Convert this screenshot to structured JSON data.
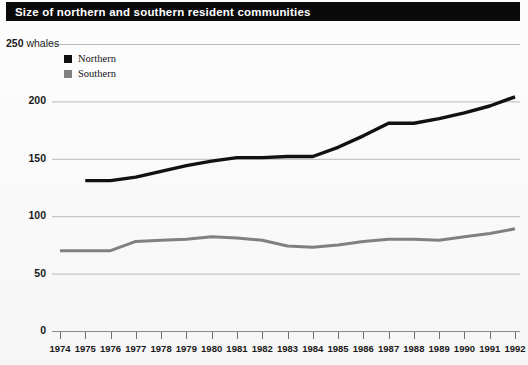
{
  "title": "Size of northern and southern resident communities",
  "legend": {
    "items": [
      {
        "label": "Northern",
        "color": "#111111"
      },
      {
        "label": "Southern",
        "color": "#808080"
      }
    ]
  },
  "axis": {
    "y_unit_label": "whales",
    "y_top_label": "250",
    "y_ticks": [
      "250",
      "200",
      "150",
      "100",
      "50",
      "0"
    ],
    "x_ticks": [
      "1974",
      "1975",
      "1976",
      "1977",
      "1978",
      "1979",
      "1980",
      "1981",
      "1982",
      "1983",
      "1984",
      "1985",
      "1986",
      "1987",
      "1988",
      "1989",
      "1990",
      "1991",
      "1992"
    ]
  },
  "chart_data": {
    "type": "line",
    "title": "Size of northern and southern resident communities",
    "xlabel": "",
    "ylabel": "whales",
    "ylim": [
      0,
      250
    ],
    "ytick_values": [
      0,
      50,
      100,
      150,
      200,
      250
    ],
    "grid": true,
    "legend_position": "top-left-inside",
    "x": [
      1974,
      1975,
      1976,
      1977,
      1978,
      1979,
      1980,
      1981,
      1982,
      1983,
      1984,
      1985,
      1986,
      1987,
      1988,
      1989,
      1990,
      1991,
      1992
    ],
    "series": [
      {
        "name": "Northern",
        "color": "#111111",
        "values": [
          null,
          131,
          131,
          134,
          139,
          144,
          148,
          151,
          151,
          152,
          152,
          160,
          170,
          181,
          181,
          185,
          190,
          196,
          204
        ]
      },
      {
        "name": "Southern",
        "color": "#808080",
        "values": [
          70,
          70,
          70,
          78,
          79,
          80,
          82,
          81,
          79,
          74,
          73,
          75,
          78,
          80,
          80,
          79,
          82,
          85,
          89
        ]
      }
    ]
  }
}
